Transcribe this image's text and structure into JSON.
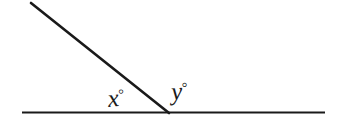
{
  "figure": {
    "type": "geometry-angle-diagram",
    "background_color": "#ffffff",
    "stroke_color": "#1a1a1a",
    "labels": {
      "left_angle": {
        "variable": "x",
        "degree_symbol": "°",
        "full_text": "x°"
      },
      "right_angle": {
        "variable": "y",
        "degree_symbol": "°",
        "full_text": "y°"
      }
    },
    "geometry": {
      "baseline": {
        "name": "horizontal-line",
        "x1": 22,
        "y1": 112.5,
        "x2": 325,
        "y2": 112.5,
        "stroke_width": 2.2
      },
      "ray": {
        "name": "slanted-ray",
        "x1": 31,
        "y1": 3,
        "x2": 169,
        "y2": 113,
        "stroke_width": 2.6
      },
      "vertex": {
        "x": 168,
        "y": 112
      }
    }
  }
}
